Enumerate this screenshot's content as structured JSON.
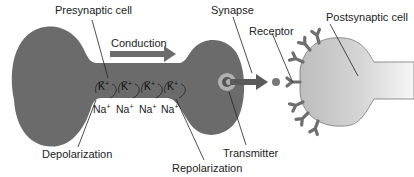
{
  "diagram": {
    "labels": {
      "presynaptic": "Presynaptic cell",
      "conduction": "Conduction",
      "synapse": "Synapse",
      "receptor": "Receptor",
      "postsynaptic": "Postsynaptic cell",
      "depolarization": "Depolarization",
      "repolarization": "Repolarization",
      "transmitter": "Transmitter"
    },
    "ions": {
      "potassium": [
        "K",
        "K",
        "K",
        "K"
      ],
      "sodium": [
        "Na",
        "Na",
        "Na",
        "Na"
      ],
      "charge": "+"
    },
    "colors": {
      "presynaptic_fill": "#6b6b6b",
      "postsynaptic_fill": "#c4c4c4",
      "postsynaptic_light": "#f2f2f2",
      "receptor_fill": "#6e6e6e",
      "arrow_fill": "#6b6b6b",
      "leader_line": "#222222",
      "transmitter_ring": "#b0b0b0"
    }
  }
}
